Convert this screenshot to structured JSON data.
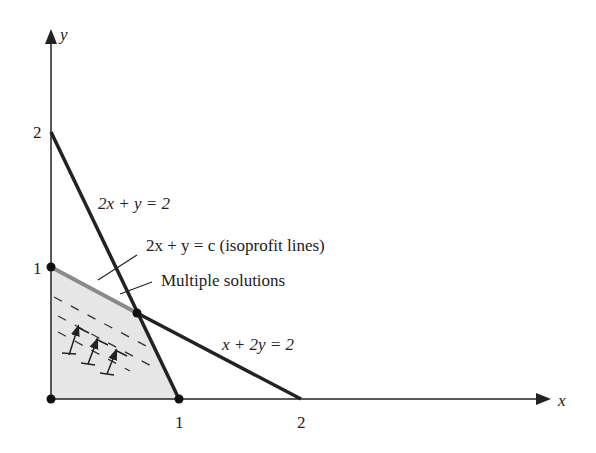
{
  "axes": {
    "x_label": "x",
    "y_label": "y",
    "x_ticks": [
      "1",
      "2"
    ],
    "y_ticks": [
      "1",
      "2"
    ]
  },
  "lines": [
    {
      "label": "2x + y = 2",
      "from": [
        0,
        2
      ],
      "to": [
        1,
        0
      ]
    },
    {
      "label": "x + 2y = 2",
      "from": [
        0,
        1
      ],
      "to": [
        2,
        0
      ]
    }
  ],
  "annotations": {
    "isoprofit": "2x + y = c (isoprofit lines)",
    "multiple": "Multiple solutions"
  },
  "labels": {
    "eq1": "2x + y = 2",
    "eq2": "x + 2y = 2"
  },
  "colors": {
    "feasible_fill": "#e6e6e6",
    "line": "#222222",
    "optimal_edge": "#8a8a8a"
  }
}
